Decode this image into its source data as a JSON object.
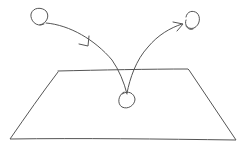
{
  "diagram": {
    "title": "",
    "style": {
      "stroke_color": "#555555",
      "background": "#ffffff",
      "stroke_width": 1
    },
    "nodes": [
      {
        "id": "ball-start",
        "shape": "circle",
        "cx": 40,
        "cy": 17,
        "r": 8.5,
        "label": ""
      },
      {
        "id": "ball-impact",
        "shape": "circle",
        "cx": 126,
        "cy": 99,
        "r": 8.5,
        "label": ""
      },
      {
        "id": "ball-end",
        "shape": "circle",
        "cx": 191,
        "cy": 20,
        "r": 8.5,
        "label": ""
      }
    ],
    "surface": {
      "id": "ground-plane",
      "shape": "quadrilateral",
      "points": [
        [
          58,
          71
        ],
        [
          188,
          69
        ],
        [
          236,
          140
        ],
        [
          10,
          139
        ]
      ],
      "label": ""
    },
    "edges": [
      {
        "id": "incoming-trajectory",
        "from": "ball-start",
        "to": "ball-impact",
        "direction": "down",
        "arrow": "mid"
      },
      {
        "id": "outgoing-trajectory",
        "from": "ball-impact",
        "to": "ball-end",
        "direction": "up",
        "arrow": "end"
      }
    ]
  }
}
